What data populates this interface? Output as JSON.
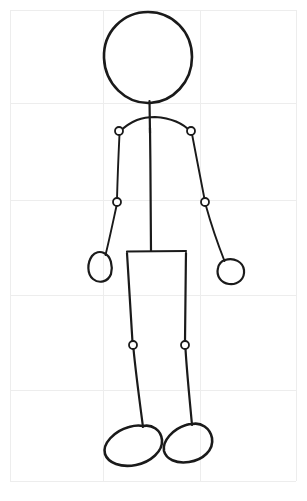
{
  "document": {
    "title": "Stick Figure Pencil Sketch",
    "medium": "pencil line drawing on lightly ruled grid paper",
    "subject": "human stick figure, front view, standing",
    "canvas": {
      "width": 307,
      "height": 501,
      "background": "#ffffff"
    }
  },
  "palette": {
    "ink": "#1a1a1a",
    "paper": "#ffffff",
    "grid": "#ededed",
    "joint_fill": "#ffffff"
  },
  "grid": {
    "label": "faint ruled guide grid",
    "visible": true,
    "color": "#ededed",
    "vertical_x": [
      10,
      103,
      200,
      296
    ],
    "horizontal_y": [
      10,
      103,
      200,
      295,
      390,
      481
    ]
  },
  "figure": {
    "name": "stick-figure",
    "parts": [
      {
        "name": "head",
        "shape": "ellipse",
        "cx": 148,
        "cy": 57,
        "rx": 44,
        "ry": 45
      },
      {
        "name": "neck",
        "shape": "line",
        "x1": 149,
        "y1": 101,
        "x2": 150,
        "y2": 133
      },
      {
        "name": "shoulder-line",
        "shape": "arc",
        "from": [
          119,
          131
        ],
        "to": [
          191,
          131
        ],
        "apex": [
          155,
          118
        ]
      },
      {
        "name": "spine",
        "shape": "line",
        "x1": 150,
        "y1": 129,
        "x2": 151,
        "y2": 251
      },
      {
        "name": "hip-line",
        "shape": "line",
        "x1": 127,
        "y1": 251,
        "x2": 186,
        "y2": 251
      },
      {
        "name": "left-upper-arm",
        "shape": "line",
        "x1": 119,
        "y1": 133,
        "x2": 117,
        "y2": 201
      },
      {
        "name": "right-upper-arm",
        "shape": "line",
        "x1": 192,
        "y1": 133,
        "x2": 205,
        "y2": 201
      },
      {
        "name": "left-forearm",
        "shape": "line",
        "x1": 117,
        "y1": 204,
        "x2": 106,
        "y2": 254
      },
      {
        "name": "right-forearm",
        "shape": "line",
        "x1": 206,
        "y1": 204,
        "x2": 225,
        "y2": 260
      },
      {
        "name": "left-hand",
        "shape": "ellipse",
        "cx": 100,
        "cy": 267,
        "rx": 13,
        "ry": 16,
        "rotation": -20
      },
      {
        "name": "right-hand",
        "shape": "ellipse",
        "cx": 231,
        "cy": 271,
        "rx": 14,
        "ry": 13,
        "rotation": 15
      },
      {
        "name": "left-thigh",
        "shape": "line",
        "x1": 127,
        "y1": 252,
        "x2": 133,
        "y2": 343
      },
      {
        "name": "right-thigh",
        "shape": "line",
        "x1": 186,
        "y1": 252,
        "x2": 185,
        "y2": 343
      },
      {
        "name": "left-shin",
        "shape": "line",
        "x1": 134,
        "y1": 348,
        "x2": 143,
        "y2": 426
      },
      {
        "name": "right-shin",
        "shape": "line",
        "x1": 185,
        "y1": 348,
        "x2": 192,
        "y2": 424
      },
      {
        "name": "left-foot",
        "shape": "ellipse",
        "cx": 132,
        "cy": 444,
        "rx": 32,
        "ry": 19,
        "rotation": -20
      },
      {
        "name": "right-foot",
        "shape": "ellipse",
        "cx": 189,
        "cy": 442,
        "rx": 28,
        "ry": 19,
        "rotation": -22
      }
    ],
    "joints": [
      {
        "name": "left-shoulder-joint",
        "cx": 119,
        "cy": 131,
        "r": 4
      },
      {
        "name": "right-shoulder-joint",
        "cx": 191,
        "cy": 131,
        "r": 4
      },
      {
        "name": "left-elbow-joint",
        "cx": 117,
        "cy": 202,
        "r": 4
      },
      {
        "name": "right-elbow-joint",
        "cx": 205,
        "cy": 202,
        "r": 4
      },
      {
        "name": "left-knee-joint",
        "cx": 133,
        "cy": 345,
        "r": 4
      },
      {
        "name": "right-knee-joint",
        "cx": 185,
        "cy": 345,
        "r": 4
      }
    ],
    "joint_count": 6,
    "limb_count": 4
  }
}
